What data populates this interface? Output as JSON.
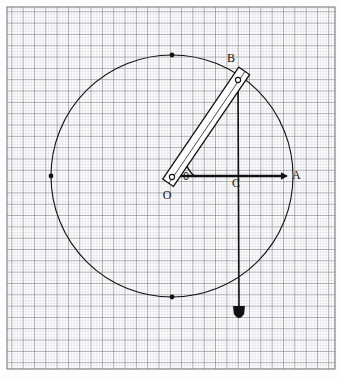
{
  "figure": {
    "kind": "mechanism-diagram",
    "background": "graph-paper",
    "paper": {
      "bg_color": "#fdfdfd",
      "minor_line_color": "#c9c9cc",
      "major_line_color": "#6f6f77",
      "minor_spacing_px": 2.83,
      "major_spacing_px": 11.32,
      "grid_rect": {
        "x": 7,
        "y": 7,
        "width": 328,
        "height": 362
      }
    },
    "ink_color": "#111111",
    "labels": {
      "origin": "O",
      "rod_end": "B",
      "center_point": "C",
      "arrow_tip": "A",
      "angle": "θ"
    },
    "geometry": {
      "circle": {
        "cx": 172,
        "cy": 176,
        "r": 121,
        "stroke": "#111111",
        "stroke_width": 1.1
      },
      "circle_markers": [
        {
          "name": "top",
          "x": 172,
          "y": 55
        },
        {
          "name": "left",
          "x": 51,
          "y": 176
        },
        {
          "name": "bottom",
          "x": 172,
          "y": 297
        }
      ],
      "pivot_O": {
        "x": 172,
        "y": 177
      },
      "joint_B": {
        "x": 238,
        "y": 80
      },
      "point_C": {
        "x": 238,
        "y": 176
      },
      "point_A": {
        "x": 288,
        "y": 176
      },
      "rod": {
        "from": {
          "x": 172,
          "y": 177
        },
        "to": {
          "x": 238,
          "y": 80
        },
        "overhang_px": 11,
        "tail_px": 7,
        "half_width_px": 6.5,
        "angle_deg": 55.8
      },
      "horizontal_arrow": {
        "x1": 172,
        "y1": 176,
        "x2": 288,
        "y2": 176
      },
      "vertical_line": {
        "x1": 238,
        "y1": 80,
        "x2": 239,
        "y2": 306
      },
      "plumb_bob": {
        "x": 239,
        "y": 306,
        "width": 12,
        "height": 16
      },
      "angle_arc": {
        "cx": 172,
        "cy": 177,
        "r": 24,
        "start_deg": 0,
        "end_deg": 55.8
      }
    },
    "label_positions": {
      "O": {
        "x": 167,
        "y": 199
      },
      "B": {
        "x": 231,
        "y": 62
      },
      "C": {
        "x": 236,
        "y": 187
      },
      "A": {
        "x": 292,
        "y": 179
      },
      "theta": {
        "x": 183,
        "y": 180
      }
    }
  }
}
